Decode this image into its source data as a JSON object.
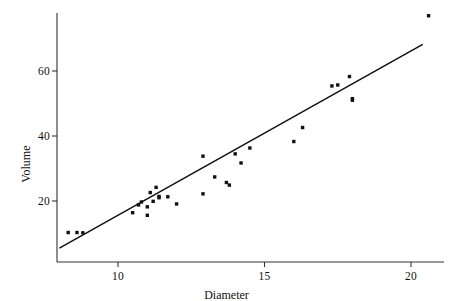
{
  "chart_data": {
    "type": "scatter",
    "title": "",
    "xlabel": "Diameter",
    "ylabel": "Volume",
    "xlim": [
      7.8,
      21.2
    ],
    "ylim": [
      6.5,
      79.0
    ],
    "grid": false,
    "legend": null,
    "xticks": [
      10,
      15,
      20
    ],
    "xtick_labels": [
      "10",
      "15",
      "20"
    ],
    "yticks": [
      20,
      40,
      60
    ],
    "ytick_labels": [
      "20",
      "40",
      "60"
    ],
    "marker": "square",
    "marker_color": "#111111",
    "marker_size_px": 3.4,
    "points": [
      {
        "x": 8.3,
        "y": 10.3
      },
      {
        "x": 8.6,
        "y": 10.3
      },
      {
        "x": 8.8,
        "y": 10.2
      },
      {
        "x": 10.5,
        "y": 16.4
      },
      {
        "x": 10.7,
        "y": 18.8
      },
      {
        "x": 10.8,
        "y": 19.7
      },
      {
        "x": 11.0,
        "y": 15.6
      },
      {
        "x": 11.0,
        "y": 18.2
      },
      {
        "x": 11.1,
        "y": 22.6
      },
      {
        "x": 11.2,
        "y": 19.9
      },
      {
        "x": 11.3,
        "y": 24.2
      },
      {
        "x": 11.4,
        "y": 21.0
      },
      {
        "x": 11.4,
        "y": 21.4
      },
      {
        "x": 11.7,
        "y": 21.3
      },
      {
        "x": 12.0,
        "y": 19.1
      },
      {
        "x": 12.9,
        "y": 22.2
      },
      {
        "x": 12.9,
        "y": 33.8
      },
      {
        "x": 13.3,
        "y": 27.4
      },
      {
        "x": 13.7,
        "y": 25.7
      },
      {
        "x": 13.8,
        "y": 24.9
      },
      {
        "x": 14.0,
        "y": 34.5
      },
      {
        "x": 14.2,
        "y": 31.7
      },
      {
        "x": 14.5,
        "y": 36.3
      },
      {
        "x": 16.0,
        "y": 38.3
      },
      {
        "x": 16.3,
        "y": 42.6
      },
      {
        "x": 17.3,
        "y": 55.4
      },
      {
        "x": 17.5,
        "y": 55.7
      },
      {
        "x": 17.9,
        "y": 58.3
      },
      {
        "x": 18.0,
        "y": 51.5
      },
      {
        "x": 18.0,
        "y": 51.0
      },
      {
        "x": 20.6,
        "y": 77.0
      }
    ],
    "fit_line": {
      "label": "least-squares fit",
      "color": "#111111",
      "x_start": 8.0,
      "y_start": 5.5,
      "x_end": 20.4,
      "y_end": 68.2
    }
  }
}
